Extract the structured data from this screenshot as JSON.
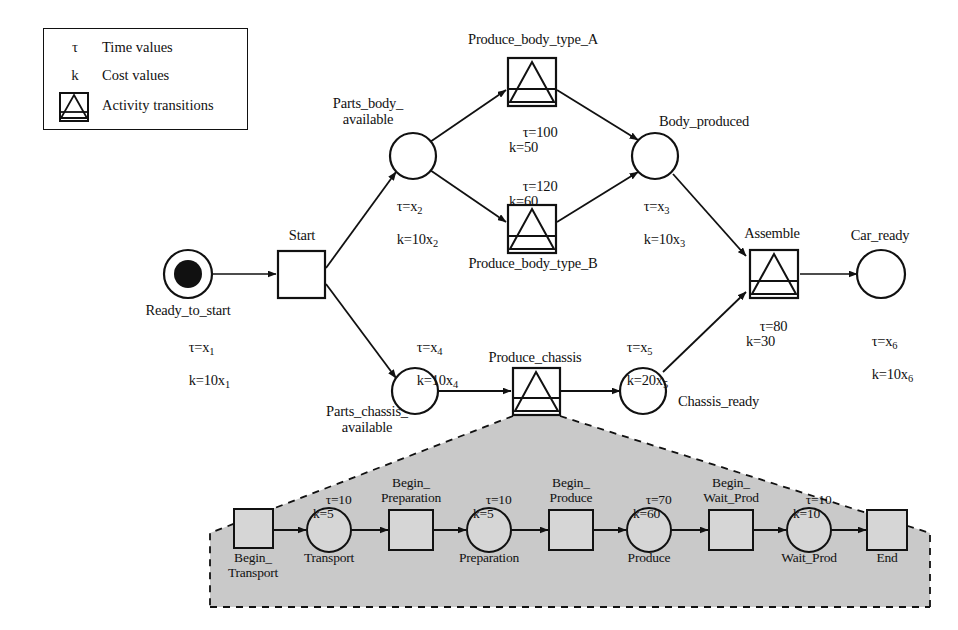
{
  "figure": {
    "type": "petri-net-diagram"
  },
  "legend": {
    "rows": [
      {
        "symbol": "τ",
        "label": "Time values",
        "icon": "tau-symbol"
      },
      {
        "symbol": "k",
        "label": "Cost values",
        "icon": "k-symbol"
      },
      {
        "symbol": "",
        "label": "Activity transitions",
        "icon": "activity-transition-icon"
      }
    ]
  },
  "main_net": {
    "places": [
      {
        "id": "ready_to_start",
        "name": "Ready_to_start",
        "tau": "τ=x",
        "tau_sub": "1",
        "k": "k=10x",
        "k_sub": "1",
        "tokens": 1
      },
      {
        "id": "parts_body_available",
        "name": "Parts_body_\navailable",
        "tau": "τ=x",
        "tau_sub": "2",
        "k": "k=10x",
        "k_sub": "2",
        "tokens": 0
      },
      {
        "id": "body_produced",
        "name": "Body_produced",
        "tau": "τ=x",
        "tau_sub": "3",
        "k": "k=10x",
        "k_sub": "3",
        "tokens": 0
      },
      {
        "id": "parts_chassis_available",
        "name": "Parts_chassis_\navailable",
        "tau": "τ=x",
        "tau_sub": "4",
        "k": "k=10x",
        "k_sub": "4",
        "tokens": 0
      },
      {
        "id": "chassis_ready",
        "name": "Chassis_ready",
        "tau": "τ=x",
        "tau_sub": "5",
        "k": "k=20x",
        "k_sub": "5",
        "tokens": 0
      },
      {
        "id": "car_ready",
        "name": "Car_ready",
        "tau": "τ=x",
        "tau_sub": "6",
        "k": "k=10x",
        "k_sub": "6",
        "tokens": 0
      }
    ],
    "transitions": [
      {
        "id": "start",
        "name": "Start",
        "kind": "plain",
        "tau": "",
        "k": ""
      },
      {
        "id": "produce_body_type_a",
        "name": "Produce_body_type_A",
        "kind": "activity",
        "tau": "τ=100",
        "k": "k=50"
      },
      {
        "id": "produce_body_type_b",
        "name": "Produce_body_type_B",
        "kind": "activity",
        "tau": "τ=120",
        "k": "k=60"
      },
      {
        "id": "produce_chassis",
        "name": "Produce_chassis",
        "kind": "activity",
        "tau": "",
        "k": ""
      },
      {
        "id": "assemble",
        "name": "Assemble",
        "kind": "activity",
        "tau": "τ=80",
        "k": "k=30"
      }
    ]
  },
  "sub_net": {
    "nodes": [
      {
        "id": "begin_transport",
        "name": "Begin_\nTransport",
        "kind": "transition",
        "tau": "",
        "k": ""
      },
      {
        "id": "transport",
        "name": "Transport",
        "kind": "place",
        "tau": "τ=10",
        "k": "k=5"
      },
      {
        "id": "begin_preparation",
        "name": "Begin_\nPreparation",
        "kind": "transition",
        "tau": "",
        "k": ""
      },
      {
        "id": "preparation",
        "name": "Preparation",
        "kind": "place",
        "tau": "τ=10",
        "k": "k=5"
      },
      {
        "id": "begin_produce",
        "name": "Begin_\nProduce",
        "kind": "transition",
        "tau": "",
        "k": ""
      },
      {
        "id": "produce",
        "name": "Produce",
        "kind": "place",
        "tau": "τ=70",
        "k": "k=60"
      },
      {
        "id": "begin_wait_prod",
        "name": "Begin_\nWait_Prod",
        "kind": "transition",
        "tau": "",
        "k": ""
      },
      {
        "id": "wait_prod",
        "name": "Wait_Prod",
        "kind": "place",
        "tau": "τ=10",
        "k": "k=10"
      },
      {
        "id": "end",
        "name": "End",
        "kind": "transition",
        "tau": "",
        "k": ""
      }
    ]
  },
  "colors": {
    "stroke": "#111111",
    "shaded_fill": "#c9c9c9",
    "background": "#ffffff",
    "token": "#111111"
  }
}
